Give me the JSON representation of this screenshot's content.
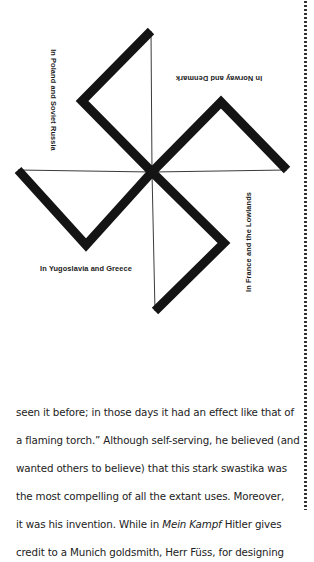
{
  "figure": {
    "colors": {
      "arm": "#141414",
      "guide_line": "#3a3a3a"
    },
    "center": [
      152,
      172
    ],
    "arms": [
      {
        "from": [
          152,
          172
        ],
        "elbow": [
          82,
          101
        ],
        "end": [
          151,
          31
        ]
      },
      {
        "from": [
          152,
          172
        ],
        "elbow": [
          221,
          102
        ],
        "end": [
          287,
          170
        ]
      },
      {
        "from": [
          152,
          172
        ],
        "elbow": [
          224,
          243
        ],
        "end": [
          155,
          311
        ]
      },
      {
        "from": [
          152,
          172
        ],
        "elbow": [
          86,
          245
        ],
        "end": [
          18,
          170
        ]
      }
    ],
    "labels": {
      "top_left": "In Poland and Soviet Russia",
      "top_right": "In Norway and Denmark",
      "bottom_left": "In Yugoslavia and Greece",
      "bottom_right": "In France and the Lowlands"
    }
  },
  "text": {
    "lines": [
      {
        "parts": [
          {
            "t": "seen it before; in those days it had an effect like that of",
            "i": false
          }
        ]
      },
      {
        "parts": [
          {
            "t": "a flaming torch.” Although self-serving, he believed (and",
            "i": false
          }
        ]
      },
      {
        "parts": [
          {
            "t": "wanted others to believe) that this stark swastika was",
            "i": false
          }
        ]
      },
      {
        "parts": [
          {
            "t": "the most compelling of all the extant uses. Moreover,",
            "i": false
          }
        ]
      },
      {
        "parts": [
          {
            "t": "it was his invention. While in ",
            "i": false
          },
          {
            "t": "Mein Kampf",
            "i": true
          },
          {
            "t": " Hitler gives",
            "i": false
          }
        ]
      },
      {
        "parts": [
          {
            "t": "credit to a Munich goldsmith, Herr Füss, for designing",
            "i": false
          }
        ]
      }
    ],
    "line1": "seen it before; in those days it had an effect like that of",
    "line2": "a flaming torch.” Although self-serving, he believed (and",
    "line3": "wanted others to believe) that this stark swastika was",
    "line4": "the most compelling of all the extant uses. Moreover,",
    "line5a": "it was his invention. While in ",
    "line5b": "Mein Kampf",
    "line5c": " Hitler gives",
    "line6": "credit to a Munich goldsmith, Herr Füss, for designing"
  }
}
